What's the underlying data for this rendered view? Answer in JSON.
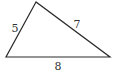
{
  "diagram": {
    "type": "triangle",
    "stroke_color": "#2a2a2a",
    "label_color": "#333333",
    "vertices": {
      "top": [
        36,
        2
      ],
      "bottom_left": [
        6,
        57
      ],
      "bottom_right": [
        110,
        57
      ]
    },
    "sides": [
      {
        "id": "left",
        "label": "5",
        "from": "bottom_left",
        "to": "top",
        "label_pos": [
          15,
          32
        ]
      },
      {
        "id": "right",
        "label": "7",
        "from": "top",
        "to": "bottom_right",
        "label_pos": [
          77,
          28
        ]
      },
      {
        "id": "base",
        "label": "8",
        "from": "bottom_left",
        "to": "bottom_right",
        "label_pos": [
          58,
          70
        ]
      }
    ]
  }
}
